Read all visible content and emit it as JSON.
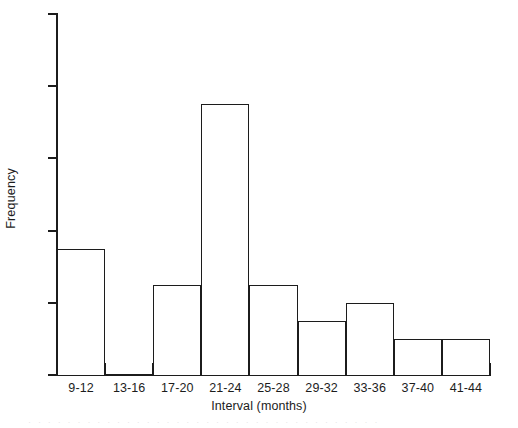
{
  "chart_data": {
    "type": "bar",
    "title": "",
    "subtitle": "",
    "xlabel": "Interval (months)",
    "ylabel": "Frequency",
    "categories": [
      "9-12",
      "13-16",
      "17-20",
      "21-24",
      "25-28",
      "29-32",
      "33-36",
      "37-40",
      "41-44"
    ],
    "values": [
      7,
      0,
      5,
      15,
      5,
      3,
      4,
      2,
      2
    ],
    "ylim": [
      0,
      20
    ],
    "yticks": [
      4,
      8,
      12,
      16,
      20
    ],
    "ytick_labels": [
      "4",
      "8",
      "12",
      "16",
      "20"
    ],
    "grid": false,
    "legend": false,
    "legend_position": "none",
    "annotations": [],
    "style": {
      "bar_fill": "#ffffff",
      "bar_outline": "#1c1c1c",
      "axis_color": "#1c1c1c",
      "background": "#ffffff",
      "bars_contiguous": true
    }
  },
  "artifact": {
    "scan_bleed_text": "· · · · · · · · · · · · · · · · · · · · · · · · · · · · · · · · · · · ·"
  }
}
